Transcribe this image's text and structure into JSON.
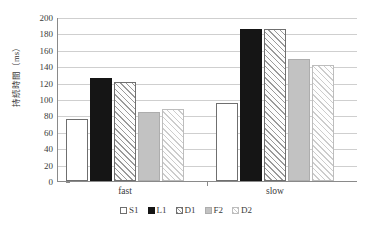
{
  "chart_data": {
    "type": "bar",
    "title": "",
    "xlabel": "",
    "ylabel": "持続時間（ms）",
    "categories": [
      "fast",
      "slow"
    ],
    "series": [
      {
        "name": "S1",
        "values": [
          76,
          95
        ],
        "fill": "white-outline"
      },
      {
        "name": "L1",
        "values": [
          126,
          185
        ],
        "fill": "solid-black"
      },
      {
        "name": "D1",
        "values": [
          121,
          185
        ],
        "fill": "diagonal-hatch"
      },
      {
        "name": "F2",
        "values": [
          84,
          149
        ],
        "fill": "solid-gray"
      },
      {
        "name": "D2",
        "values": [
          88,
          142
        ],
        "fill": "light-diagonal-hatch"
      }
    ],
    "ylim": [
      0,
      200
    ],
    "ytick_step": 20,
    "yticks": [
      200,
      180,
      160,
      140,
      120,
      100,
      80,
      60,
      40,
      20,
      0
    ],
    "grid": true,
    "legend_position": "bottom-center"
  },
  "axes": {
    "y_label": "持続時間（ms）",
    "y_ticks": [
      "200",
      "180",
      "160",
      "140",
      "120",
      "100",
      "80",
      "60",
      "40",
      "20",
      "0"
    ],
    "x_categories": [
      "fast",
      "slow"
    ]
  },
  "legend": {
    "entries": [
      {
        "label": "S1"
      },
      {
        "label": "L1"
      },
      {
        "label": "D1"
      },
      {
        "label": "F2"
      },
      {
        "label": "D2"
      }
    ]
  },
  "colors": {
    "solid_black": "#151515",
    "solid_gray": "#c2c2c2",
    "hatch_line": "#9a9a9a",
    "light_hatch_line": "#cccccc",
    "gridline": "#cfcfcf",
    "axis": "#8a8a8a",
    "text": "#3a3a3a",
    "background": "#ffffff"
  }
}
